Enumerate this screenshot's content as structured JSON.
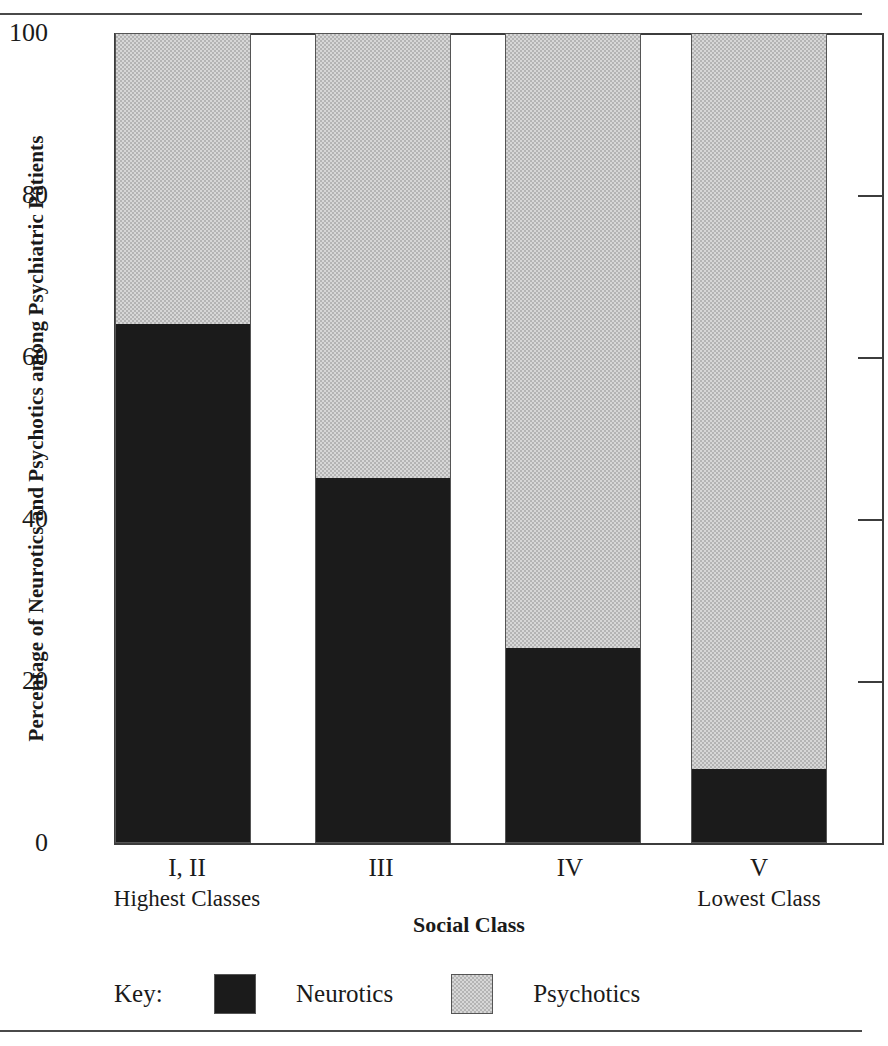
{
  "chart_data": {
    "type": "bar",
    "subtype": "stacked-bar-100-percent",
    "title": "",
    "xlabel": "Social Class",
    "ylabel": "Percentage of Neurotics and Psychotics among Psychiatric Patients",
    "categories": [
      "I, II",
      "III",
      "IV",
      "V"
    ],
    "category_sublabels": [
      "Highest Classes",
      "",
      "",
      "Lowest Class"
    ],
    "series": [
      {
        "name": "Neurotics",
        "values": [
          64,
          45,
          24,
          9
        ],
        "color": "#1b1b1b"
      },
      {
        "name": "Psychotics",
        "values": [
          36,
          55,
          76,
          91
        ],
        "color": "#d7d7d7"
      }
    ],
    "ylim": [
      0,
      100
    ],
    "yticks": [
      0,
      20,
      40,
      60,
      80,
      100
    ],
    "ytick_labels": [
      "0",
      "20",
      "40",
      "60",
      "80",
      "100"
    ],
    "grid": false,
    "legend_position": "bottom",
    "legend_title": "Key:"
  },
  "axis": {
    "y_title": "Percentage of Neurotics and Psychotics among Psychiatric Patients",
    "x_title": "Social Class",
    "ticks": [
      {
        "label": "100",
        "value": 100
      },
      {
        "label": "80",
        "value": 80
      },
      {
        "label": "60",
        "value": 60
      },
      {
        "label": "40",
        "value": 40
      },
      {
        "label": "20",
        "value": 20
      },
      {
        "label": "0",
        "value": 0
      }
    ]
  },
  "bars": [
    {
      "category": "I, II",
      "sublabel": "Highest Classes",
      "neurotics": 64,
      "psychotics": 36
    },
    {
      "category": "III",
      "sublabel": "",
      "neurotics": 45,
      "psychotics": 55
    },
    {
      "category": "IV",
      "sublabel": "",
      "neurotics": 24,
      "psychotics": 76
    },
    {
      "category": "V",
      "sublabel": "Lowest Class",
      "neurotics": 9,
      "psychotics": 91
    }
  ],
  "legend": {
    "key_label": "Key:",
    "entries": [
      {
        "label": "Neurotics",
        "swatch": "dark-swatch"
      },
      {
        "label": "Psychotics",
        "swatch": "light-swatch"
      }
    ]
  }
}
